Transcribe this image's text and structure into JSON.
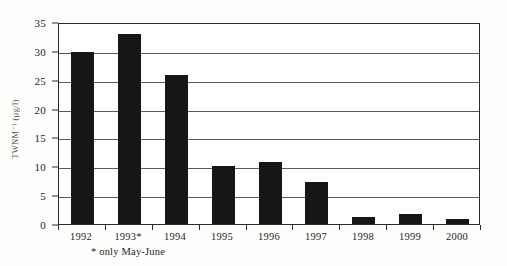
{
  "chart_data": {
    "type": "bar",
    "title": "",
    "subtitle": "",
    "xlabel": "",
    "ylabel": "TWNM⁻¹ (µg/l)",
    "categories": [
      "1992",
      "1993*",
      "1994",
      "1995",
      "1996",
      "1997",
      "1998",
      "1999",
      "2000"
    ],
    "values": [
      29.8,
      33.0,
      25.8,
      10.0,
      10.7,
      7.3,
      1.3,
      1.8,
      0.9
    ],
    "ylim": [
      0,
      35
    ],
    "y_ticks": [
      0,
      5,
      10,
      15,
      20,
      25,
      30,
      35
    ],
    "y_tick_labels": [
      "0",
      "5",
      "10",
      "15",
      "20",
      "25",
      "30",
      "35"
    ],
    "grid": true,
    "grid_orientation": "horizontal",
    "legend": false,
    "legend_position": "none",
    "bar_color": "#161616",
    "axis_color": "#2b2b2b",
    "gridline_color": "#5a5a5a",
    "background_color": "#ffffff",
    "annotations": [
      {
        "text": "* only May-June",
        "anchor_category": "1993*",
        "position": "below-axis"
      }
    ]
  },
  "figure": {
    "footnote": "* only May-June",
    "page_background": "#fdfdfc"
  }
}
